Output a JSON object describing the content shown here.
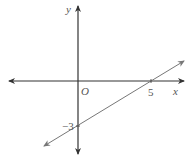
{
  "diagram": {
    "type": "coordinate-plane-line",
    "axes": {
      "x_label": "x",
      "y_label": "y",
      "origin_label": "O"
    },
    "line": {
      "x_intercept_label": "5",
      "y_intercept_label": "−3",
      "x_intercept": 5,
      "y_intercept": -3
    },
    "colors": {
      "axis": "#333333",
      "line": "#777777",
      "text": "#555555"
    }
  }
}
